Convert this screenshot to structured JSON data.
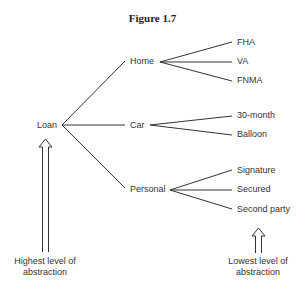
{
  "title": "Figure 1.7",
  "root": {
    "label": "Loan"
  },
  "categories": [
    {
      "label": "Home",
      "children": [
        "FHA",
        "VA",
        "FNMA"
      ]
    },
    {
      "label": "Car",
      "children": [
        "30-month",
        "Balloon"
      ]
    },
    {
      "label": "Personal",
      "children": [
        "Signature",
        "Secured",
        "Second party"
      ]
    }
  ],
  "annotations": {
    "highest": {
      "line1": "Highest level of",
      "line2": "abstraction"
    },
    "lowest": {
      "line1": "Lowest level of",
      "line2": "abstraction"
    }
  },
  "colors": {
    "line": "#333333",
    "text": "#333333"
  }
}
